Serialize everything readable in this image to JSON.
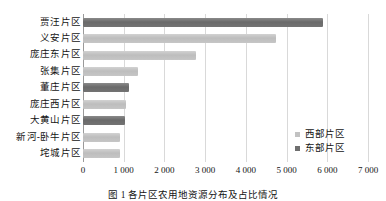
{
  "chart_data": {
    "type": "bar",
    "orientation": "horizontal",
    "title": "",
    "xlabel": "",
    "ylabel": "",
    "xlim": [
      0,
      7000
    ],
    "xticks": [
      0,
      1000,
      2000,
      3000,
      4000,
      5000,
      6000,
      7000
    ],
    "xtick_labels": [
      "0",
      "1 000",
      "2 000",
      "3 000",
      "4 000",
      "5 000",
      "6 000",
      "7 000"
    ],
    "grid": true,
    "legend_position": "right-inside",
    "categories": [
      "贾汪片区",
      "义安片区",
      "庞庄东片区",
      "张集片区",
      "董庄片区",
      "庞庄西片区",
      "大黄山片区",
      "新河-卧牛片区",
      "垞城片区"
    ],
    "series": [
      {
        "name": "东部片区",
        "color": "#6f6f6f",
        "values": [
          5900,
          null,
          null,
          null,
          1130,
          null,
          1020,
          null,
          null
        ]
      },
      {
        "name": "西部片区",
        "color": "#c2c2c2",
        "values": [
          null,
          4750,
          2780,
          1350,
          null,
          1050,
          null,
          900,
          900
        ]
      }
    ],
    "bars": [
      {
        "category": "贾汪片区",
        "value": 5900,
        "series": "东部片区"
      },
      {
        "category": "义安片区",
        "value": 4750,
        "series": "西部片区"
      },
      {
        "category": "庞庄东片区",
        "value": 2780,
        "series": "西部片区"
      },
      {
        "category": "张集片区",
        "value": 1350,
        "series": "西部片区"
      },
      {
        "category": "董庄片区",
        "value": 1130,
        "series": "东部片区"
      },
      {
        "category": "庞庄西片区",
        "value": 1050,
        "series": "西部片区"
      },
      {
        "category": "大黄山片区",
        "value": 1020,
        "series": "东部片区"
      },
      {
        "category": "新河-卧牛片区",
        "value": 900,
        "series": "西部片区"
      },
      {
        "category": "垞城片区",
        "value": 900,
        "series": "西部片区"
      }
    ],
    "legend": [
      {
        "label": "西部片区",
        "series": "west",
        "color": "#c2c2c2"
      },
      {
        "label": "东部片区",
        "series": "east",
        "color": "#6f6f6f"
      }
    ]
  },
  "caption": {
    "text": "图 1  各片区农用地资源分布及占比情况"
  }
}
